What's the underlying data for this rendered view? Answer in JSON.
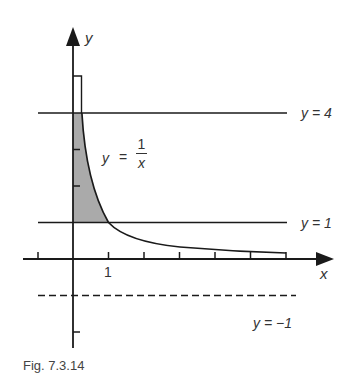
{
  "figure": {
    "caption": "Fig. 7.3.14",
    "axis_labels": {
      "x": "x",
      "y": "y"
    },
    "tick_label_x1": "1",
    "curve_label": {
      "lhs": "y",
      "eq": "=",
      "numerator": "1",
      "denominator": "x"
    },
    "line_labels": {
      "y4": "y = 4",
      "y1": "y = 1",
      "ym1": "y = −1"
    },
    "colors": {
      "ink": "#1a1a1a",
      "shade": "#aaaaaa",
      "label": "#333333"
    },
    "lines": [
      {
        "name": "y=4",
        "y": 4,
        "style": "solid"
      },
      {
        "name": "y=1",
        "y": 1,
        "style": "solid"
      },
      {
        "name": "y=-1",
        "y": -1,
        "style": "dashed"
      }
    ],
    "curve": "y = 1/x",
    "shaded_region": "between y-axis, y = 1/x, y = 1 and y = 4",
    "x_ticks": [
      -1,
      1,
      2,
      3,
      4,
      5,
      6
    ],
    "y_ticks": [
      2,
      3,
      -2
    ]
  }
}
